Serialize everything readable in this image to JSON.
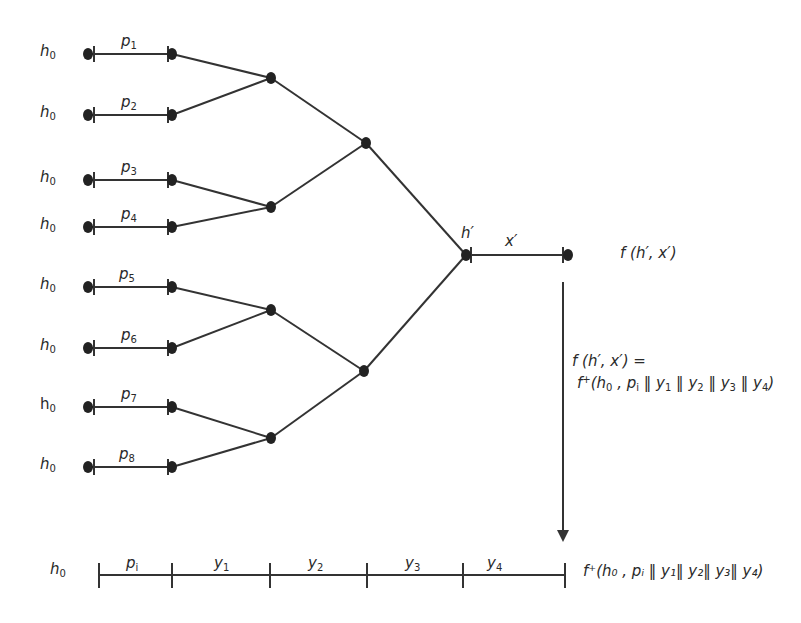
{
  "diagram": {
    "type": "merkle-hash-tree",
    "leaves": [
      {
        "h_label": "h",
        "h_sub": "0",
        "p_label": "p",
        "p_sub": "1",
        "y": 54
      },
      {
        "h_label": "h",
        "h_sub": "0",
        "p_label": "p",
        "p_sub": "2",
        "y": 115
      },
      {
        "h_label": "h",
        "h_sub": "0",
        "p_label": "p",
        "p_sub": "3",
        "y": 180
      },
      {
        "h_label": "h",
        "h_sub": "0",
        "p_label": "p",
        "p_sub": "4",
        "y": 227
      },
      {
        "h_label": "h",
        "h_sub": "0",
        "p_label": "p",
        "p_sub": "5",
        "y": 287
      },
      {
        "h_label": "h",
        "h_sub": "0",
        "p_label": "p",
        "p_sub": "6",
        "y": 348
      },
      {
        "h_label": "h",
        "h_sub": "0",
        "p_label": "p",
        "p_sub": "7",
        "y": 407
      },
      {
        "h_label": "h",
        "h_sub": "0",
        "p_label": "p",
        "p_sub": "8",
        "y": 467
      }
    ],
    "root": {
      "h_label": "h′",
      "x_label": "x′",
      "output_label": "f (h′, x′)"
    },
    "equation": {
      "line1": "f (h′, x′) =",
      "line2_prefix": "f",
      "line2_sup": "+",
      "line2_body": "(h",
      "line2_h_sub": "0",
      "line2_rest": " , p",
      "line2_p_sub": "i",
      "terms": [
        "y",
        "y",
        "y",
        "y"
      ],
      "term_subs": [
        "1",
        "2",
        "3",
        "4"
      ],
      "separator": " ‖ "
    },
    "bottom_chain": {
      "h_label": "h",
      "h_sub": "0",
      "segments": [
        {
          "label": "p",
          "sub": "i"
        },
        {
          "label": "y",
          "sub": "1"
        },
        {
          "label": "y",
          "sub": "2"
        },
        {
          "label": "y",
          "sub": "3"
        },
        {
          "label": "y",
          "sub": "4"
        }
      ],
      "result_label": "f⁺(h₀ , pᵢ ‖ y₁‖ y₂‖ y₃‖ y₄)"
    },
    "colors": {
      "line": "#333333",
      "node": "#222222",
      "text": "#2a2a2a"
    }
  }
}
